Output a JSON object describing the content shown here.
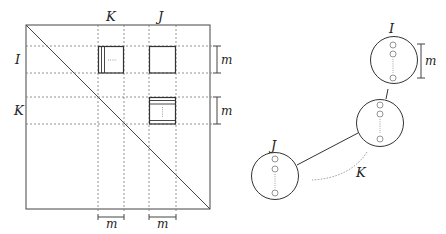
{
  "matrix": {
    "col_labels": {
      "K": "K",
      "J": "J"
    },
    "row_labels": {
      "I": "I",
      "K": "K"
    },
    "block_size_label": "m",
    "brackets": {
      "right_top": "m",
      "right_bottom": "m",
      "bottom_left": "m",
      "bottom_right": "m"
    },
    "colors": {
      "frame": "#444444",
      "grid": "#777777",
      "block": "#333333"
    }
  },
  "graph": {
    "nodes": [
      {
        "id": "I",
        "label": "I"
      },
      {
        "id": "K",
        "label": ""
      },
      {
        "id": "J",
        "label": "J"
      }
    ],
    "edge_label": "K",
    "bracket_label": "m",
    "colors": {
      "node_stroke": "#333333",
      "dot": "#888888"
    }
  }
}
